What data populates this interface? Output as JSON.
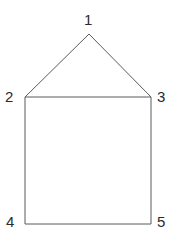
{
  "figure": {
    "name": "house-shaped-polygon",
    "background_color": "#ffffff",
    "stroke_color": "#5a5a5a",
    "stroke_width": 1,
    "fill_color": "none",
    "label_color": "#2b2b2b",
    "canvas": {
      "width": 177,
      "height": 243
    }
  },
  "vertices": [
    {
      "id": "1",
      "label": "1",
      "role": "apex",
      "x": 89,
      "y": 34,
      "label_x": 84,
      "label_y": 12
    },
    {
      "id": "2",
      "label": "2",
      "role": "eave-left",
      "x": 25,
      "y": 97,
      "label_x": 5,
      "label_y": 89
    },
    {
      "id": "3",
      "label": "3",
      "role": "eave-right",
      "x": 151,
      "y": 97,
      "label_x": 157,
      "label_y": 89
    },
    {
      "id": "4",
      "label": "4",
      "role": "base-left",
      "x": 25,
      "y": 224,
      "label_x": 6,
      "label_y": 214
    },
    {
      "id": "5",
      "label": "5",
      "role": "base-right",
      "x": 151,
      "y": 224,
      "label_x": 157,
      "label_y": 214
    }
  ],
  "edges": [
    {
      "name": "roof-left-edge",
      "from": "2",
      "to": "1"
    },
    {
      "name": "roof-right-edge",
      "from": "1",
      "to": "3"
    },
    {
      "name": "eave-line",
      "from": "2",
      "to": "3"
    },
    {
      "name": "wall-left-edge",
      "from": "2",
      "to": "4"
    },
    {
      "name": "wall-right-edge",
      "from": "3",
      "to": "5"
    },
    {
      "name": "base-line",
      "from": "4",
      "to": "5"
    }
  ],
  "polygon_points": "89,34 151,97 151,224 25,224 25,97"
}
